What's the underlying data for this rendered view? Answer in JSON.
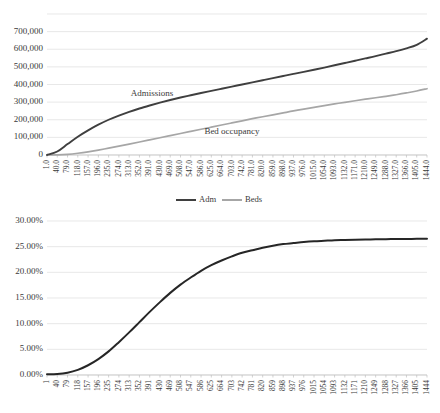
{
  "figure": {
    "background": "#ffffff",
    "colors": {
      "admissions_line": "#3f3f3f",
      "beds_line": "#a6a6a6",
      "percent_line": "#262626",
      "gridline": "#d9d9d9",
      "axis": "#bfbfbf",
      "text": "#3a3a3a"
    }
  },
  "chart_data": [
    {
      "id": "top",
      "type": "line",
      "title": "",
      "subtitle": "",
      "xlabel": "",
      "ylabel": "",
      "grid": true,
      "legend_position": "bottom",
      "ylim": [
        0,
        800000
      ],
      "ytick_values": [
        0,
        100000,
        200000,
        300000,
        400000,
        500000,
        600000,
        700000
      ],
      "ytick_labels": [
        "0",
        "100,000",
        "200,000",
        "300,000",
        "400,000",
        "500,000",
        "600,000",
        "700,000"
      ],
      "x": [
        1,
        40,
        79,
        118,
        157,
        196,
        235,
        274,
        313,
        352,
        391,
        430,
        469,
        508,
        547,
        586,
        625,
        664,
        703,
        742,
        781,
        820,
        859,
        898,
        937,
        976,
        1015,
        1054,
        1093,
        1132,
        1171,
        1210,
        1249,
        1288,
        1327,
        1366,
        1405,
        1444
      ],
      "xtick_labels": [
        "1.0",
        "40.0",
        "79.0",
        "118.0",
        "157.0",
        "196.0",
        "235.0",
        "274.0",
        "313.0",
        "352.0",
        "391.0",
        "430.0",
        "469.0",
        "508.0",
        "547.0",
        "586.0",
        "625.0",
        "664.0",
        "703.0",
        "742.0",
        "781.0",
        "820.0",
        "859.0",
        "898.0",
        "937.0",
        "976.0",
        "1015.0",
        "1054.0",
        "1093.0",
        "1132.0",
        "1171.0",
        "1210.0",
        "1249.0",
        "1288.0",
        "1327.0",
        "1366.0",
        "1405.0",
        "1444.0"
      ],
      "series": [
        {
          "name": "Adm",
          "annotation": "Admissions",
          "color": "#3f3f3f",
          "values": [
            0,
            20000,
            62000,
            104000,
            140000,
            172000,
            200000,
            224000,
            245000,
            264000,
            281000,
            297000,
            312000,
            326000,
            339000,
            352000,
            364000,
            376000,
            388000,
            400000,
            412000,
            424000,
            436000,
            448000,
            460000,
            472000,
            484000,
            496000,
            509000,
            522000,
            535000,
            548000,
            561000,
            575000,
            589000,
            605000,
            625000,
            660000
          ]
        },
        {
          "name": "Beds",
          "annotation": "Bed occupancy",
          "color": "#a6a6a6",
          "values": [
            0,
            1000,
            4000,
            10000,
            18000,
            28000,
            39000,
            50000,
            62000,
            74000,
            86000,
            98000,
            110000,
            122000,
            134000,
            146000,
            158000,
            170000,
            182000,
            194000,
            206000,
            217000,
            228000,
            239000,
            250000,
            260000,
            270000,
            280000,
            290000,
            299000,
            308000,
            317000,
            325000,
            333000,
            342000,
            352000,
            363000,
            376000
          ]
        }
      ],
      "legend": [
        {
          "label": "Adm",
          "color": "#3f3f3f"
        },
        {
          "label": "Beds",
          "color": "#a6a6a6"
        }
      ]
    },
    {
      "id": "bottom",
      "type": "line",
      "title": "",
      "subtitle": "",
      "xlabel": "",
      "ylabel": "",
      "grid": true,
      "legend_position": "none",
      "ylim": [
        0,
        30
      ],
      "ytick_values": [
        0,
        5,
        10,
        15,
        20,
        25,
        30
      ],
      "ytick_labels": [
        "0.00%",
        "5.00%",
        "10.00%",
        "15.00%",
        "20.00%",
        "25.00%",
        "30.00%"
      ],
      "x": [
        1,
        40,
        79,
        118,
        157,
        196,
        235,
        274,
        313,
        352,
        391,
        430,
        469,
        508,
        547,
        586,
        625,
        664,
        703,
        742,
        781,
        820,
        859,
        898,
        937,
        976,
        1015,
        1054,
        1093,
        1132,
        1171,
        1210,
        1249,
        1288,
        1327,
        1366,
        1405,
        1444
      ],
      "xtick_labels": [
        "1",
        "40",
        "79",
        "118",
        "157",
        "196",
        "235",
        "274",
        "313",
        "352",
        "391",
        "430",
        "469",
        "508",
        "547",
        "586",
        "625",
        "664",
        "703",
        "742",
        "781",
        "820",
        "859",
        "898",
        "937",
        "976",
        "1015",
        "1054",
        "1093",
        "1132",
        "1171",
        "1210",
        "1249",
        "1288",
        "1327",
        "1366",
        "1405",
        "1444"
      ],
      "series": [
        {
          "name": "Percent",
          "annotation": "",
          "color": "#262626",
          "values": [
            0.15,
            0.2,
            0.45,
            1.0,
            1.9,
            3.1,
            4.6,
            6.4,
            8.3,
            10.3,
            12.3,
            14.2,
            16.0,
            17.6,
            19.0,
            20.3,
            21.4,
            22.3,
            23.1,
            23.8,
            24.3,
            24.8,
            25.2,
            25.5,
            25.7,
            25.9,
            26.05,
            26.15,
            26.25,
            26.3,
            26.35,
            26.4,
            26.43,
            26.46,
            26.48,
            26.5,
            26.52,
            26.53
          ]
        }
      ],
      "legend": []
    }
  ]
}
